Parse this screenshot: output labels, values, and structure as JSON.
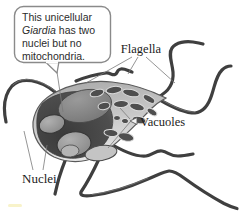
{
  "figure_title": "Giardia cell diagram",
  "callout": {
    "line1": "This unicellular",
    "line2_italic": "Giardia",
    "line2_rest": "has two",
    "line3": "nuclei but no",
    "line4": "mitochondria."
  },
  "labels": {
    "flagella": "Flagella",
    "vacuoles": "Vacuoles",
    "nuclei": "Nuclei"
  },
  "colors": {
    "background": "#ffffff",
    "cell_body_light": "#c9c9c9",
    "cell_body_highlight": "#e6e6e6",
    "adhesive_disc_dark": "#454545",
    "dome_gray": "#878787",
    "nucleus_gray": "#929292",
    "vacuole_dark": "#4e4e4e",
    "vacuole_halo": "#dcdcdc",
    "flagellum": "#3f3f3f",
    "outline": "#565656",
    "pointer_line": "#7a7a7a",
    "label_text": "#1c1c1c",
    "callout_border": "#8a8a8a",
    "artifact_yellow": "#efe48a"
  },
  "icons": {
    "vacuoles_arrowhead": "left-pointing open triangle"
  }
}
